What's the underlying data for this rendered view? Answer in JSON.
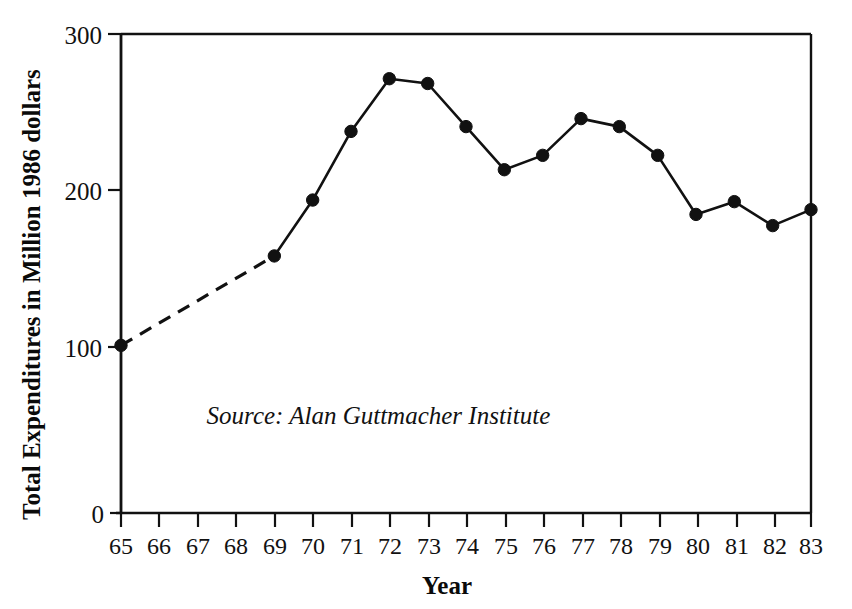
{
  "chart_data": {
    "type": "line",
    "title": "",
    "subtitle": "",
    "xlabel": "Year",
    "ylabel": "Total Expenditures in Million 1986 dollars",
    "xlim": [
      65,
      83
    ],
    "ylim": [
      0,
      300
    ],
    "grid": false,
    "legend": "none",
    "x_tick_labels": [
      "65",
      "66",
      "67",
      "68",
      "69",
      "70",
      "71",
      "72",
      "73",
      "74",
      "75",
      "76",
      "77",
      "78",
      "79",
      "80",
      "81",
      "82",
      "83"
    ],
    "y_tick_labels": [
      "0",
      "100",
      "200",
      "300"
    ],
    "y_ticks": [
      0,
      100,
      200,
      300
    ],
    "x": [
      65,
      69,
      70,
      71,
      72,
      73,
      74,
      75,
      76,
      77,
      78,
      79,
      80,
      81,
      82,
      83
    ],
    "values": [
      105,
      161,
      196,
      239,
      272,
      269,
      242,
      215,
      224,
      247,
      242,
      224,
      187,
      195,
      180,
      190
    ],
    "series": [
      {
        "name": "Total Expenditures",
        "x": [
          65,
          69,
          70,
          71,
          72,
          73,
          74,
          75,
          76,
          77,
          78,
          79,
          80,
          81,
          82,
          83
        ],
        "values": [
          105,
          161,
          196,
          239,
          272,
          269,
          242,
          215,
          224,
          247,
          242,
          224,
          187,
          195,
          180,
          190
        ]
      }
    ],
    "segments": [
      {
        "name": "interpolated-segment",
        "style": "dashed",
        "x": [
          65,
          69
        ],
        "values": [
          105,
          161
        ],
        "markers": true
      },
      {
        "name": "measured-segment",
        "style": "solid",
        "x": [
          69,
          70,
          71,
          72,
          73,
          74,
          75,
          76,
          77,
          78,
          79,
          80,
          81,
          82,
          83
        ],
        "values": [
          161,
          196,
          239,
          272,
          269,
          242,
          215,
          224,
          247,
          242,
          224,
          187,
          195,
          180,
          190
        ],
        "markers": true
      }
    ],
    "annotations": [
      {
        "name": "source-note",
        "text": "Source: Alan Guttmacher Institute",
        "x": 76.2,
        "y": 56
      }
    ],
    "colors": {
      "line": "#111111",
      "marker": "#111111",
      "axis": "#111111",
      "background": "#ffffff"
    }
  },
  "axes": {
    "y_title": "Total Expenditures in Million 1986 dollars",
    "x_title": "Year",
    "y_tick_0": "0",
    "y_tick_100": "100",
    "y_tick_200": "200",
    "y_tick_300": "300"
  },
  "x_ticks": {
    "t65": "65",
    "t66": "66",
    "t67": "67",
    "t68": "68",
    "t69": "69",
    "t70": "70",
    "t71": "71",
    "t72": "72",
    "t73": "73",
    "t74": "74",
    "t75": "75",
    "t76": "76",
    "t77": "77",
    "t78": "78",
    "t79": "79",
    "t80": "80",
    "t81": "81",
    "t82": "82",
    "t83": "83"
  },
  "source": {
    "text": "Source: Alan Guttmacher Institute"
  }
}
